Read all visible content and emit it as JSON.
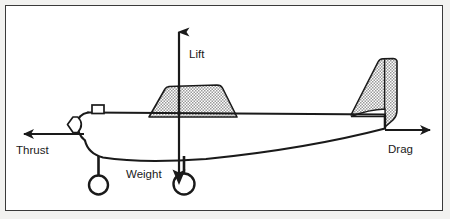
{
  "figure": {
    "background_color": "#f2f2f0",
    "panel_color": "#ffffff",
    "border_color": "#3a3a3a",
    "line_color": "#1a1a1a",
    "hatch_fill_color": "#b8b8b8"
  },
  "forces": [
    {
      "id": "lift",
      "label": "Lift",
      "direction": "up",
      "arrow_from": [
        178,
        112
      ],
      "arrow_to": [
        178,
        20
      ],
      "label_position": [
        187,
        48
      ]
    },
    {
      "id": "thrust",
      "label": "Thrust",
      "direction": "left",
      "arrow_from": [
        80,
        133
      ],
      "arrow_to": [
        10,
        133
      ],
      "label_position": [
        10,
        153
      ]
    },
    {
      "id": "drag",
      "label": "Drag",
      "direction": "right",
      "arrow_from": [
        385,
        129
      ],
      "arrow_to": [
        437,
        129
      ],
      "label_position": [
        393,
        152
      ]
    },
    {
      "id": "weight",
      "label": "Weight",
      "direction": "down",
      "arrow_from": [
        178,
        112
      ],
      "arrow_to": [
        178,
        180
      ],
      "label_position": [
        128,
        176
      ]
    }
  ],
  "aircraft_parts": [
    {
      "id": "fuselage",
      "name": "fuselage"
    },
    {
      "id": "nose-spinner",
      "name": "propeller-spinner"
    },
    {
      "id": "cabin-window",
      "name": "cabin-window"
    },
    {
      "id": "wing",
      "name": "wing",
      "fill": "hatched"
    },
    {
      "id": "vertical-stabilizer",
      "name": "vertical-stabilizer",
      "fill": "hatched"
    },
    {
      "id": "horizontal-stabilizer",
      "name": "horizontal-stabilizer"
    },
    {
      "id": "main-wheel-front",
      "name": "landing-gear-wheel-front"
    },
    {
      "id": "main-wheel-rear",
      "name": "landing-gear-wheel-rear"
    }
  ]
}
